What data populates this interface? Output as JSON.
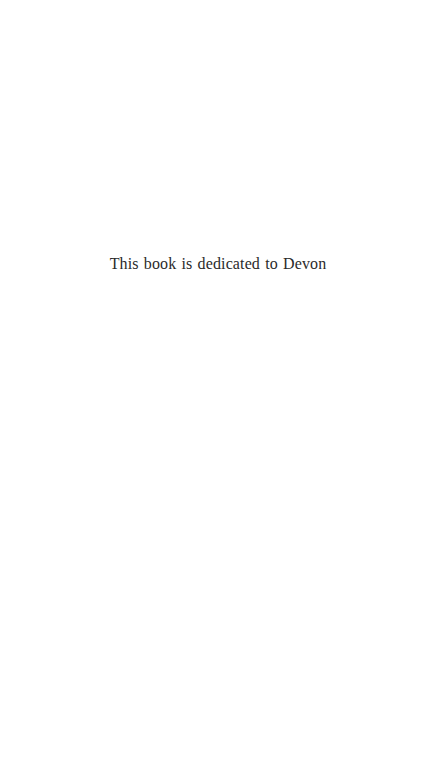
{
  "page": {
    "kind": "book-dedication-page",
    "background_color": "#ffffff",
    "width_px": 436,
    "height_px": 762
  },
  "dedication": {
    "text": "This book is dedicated to Devon",
    "text_color": "#2a2a2a",
    "font_size_px": 16,
    "alignment": "center"
  }
}
